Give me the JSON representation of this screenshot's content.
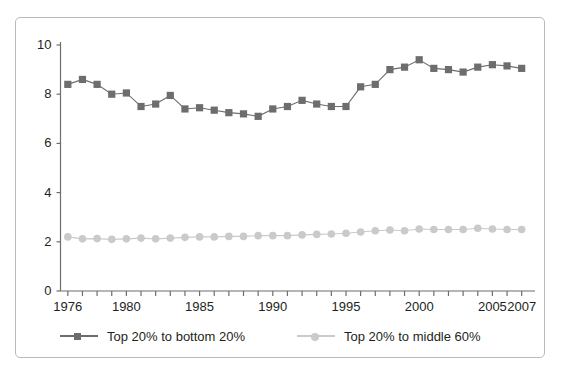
{
  "chart_data": {
    "type": "line",
    "title": "",
    "subtitle": "",
    "xlabel": "",
    "ylabel": "",
    "xlim": [
      1975.5,
      2007.5
    ],
    "ylim": [
      0,
      10
    ],
    "grid": false,
    "legend_position": "bottom-left",
    "x": [
      1976,
      1977,
      1978,
      1979,
      1980,
      1981,
      1982,
      1983,
      1984,
      1985,
      1986,
      1987,
      1988,
      1989,
      1990,
      1991,
      1992,
      1993,
      1994,
      1995,
      1996,
      1997,
      1998,
      1999,
      2000,
      2001,
      2002,
      2003,
      2004,
      2005,
      2006,
      2007
    ],
    "xticks": [
      1976,
      1977,
      1978,
      1979,
      1980,
      1981,
      1982,
      1983,
      1984,
      1985,
      1986,
      1987,
      1988,
      1989,
      1990,
      1991,
      1992,
      1993,
      1994,
      1995,
      1996,
      1997,
      1998,
      1999,
      2000,
      2001,
      2002,
      2003,
      2004,
      2005,
      2006,
      2007
    ],
    "xticklabels": [
      {
        "value": 1976,
        "text": "1976"
      },
      {
        "value": 1980,
        "text": "1980"
      },
      {
        "value": 1985,
        "text": "1985"
      },
      {
        "value": 1990,
        "text": "1990"
      },
      {
        "value": 1995,
        "text": "1995"
      },
      {
        "value": 2000,
        "text": "2000"
      },
      {
        "value": 2005,
        "text": "2005"
      },
      {
        "value": 2007,
        "text": "2007"
      }
    ],
    "yticks": [
      0,
      2,
      4,
      6,
      8,
      10
    ],
    "yticklabels": [
      "0",
      "2",
      "4",
      "6",
      "8",
      "10"
    ],
    "series": [
      {
        "name": "Top 20% to bottom 20%",
        "color": "#6d6d6d",
        "marker": "square",
        "values": [
          8.4,
          8.6,
          8.4,
          8.0,
          8.05,
          7.5,
          7.6,
          7.95,
          7.4,
          7.45,
          7.35,
          7.25,
          7.2,
          7.1,
          7.4,
          7.5,
          7.75,
          7.6,
          7.5,
          7.5,
          8.3,
          8.4,
          9.0,
          9.1,
          9.4,
          9.05,
          9.0,
          8.9,
          9.1,
          9.2,
          9.15,
          9.05
        ]
      },
      {
        "name": "Top 20% to middle 60%",
        "color": "#c9cacc",
        "marker": "circle",
        "values": [
          2.2,
          2.12,
          2.13,
          2.1,
          2.12,
          2.15,
          2.12,
          2.15,
          2.18,
          2.2,
          2.2,
          2.22,
          2.22,
          2.25,
          2.25,
          2.25,
          2.28,
          2.3,
          2.32,
          2.35,
          2.4,
          2.45,
          2.48,
          2.45,
          2.52,
          2.5,
          2.5,
          2.5,
          2.55,
          2.52,
          2.5,
          2.5
        ]
      }
    ]
  },
  "legend": {
    "entries": [
      {
        "label": "Top 20% to bottom 20%"
      },
      {
        "label": "Top 20% to middle 60%"
      }
    ]
  },
  "colors": {
    "series1": "#6d6d6d",
    "series2": "#c9cacc",
    "axis": "#6d6d6d",
    "text": "#231f20",
    "border": "#b9b9b9"
  }
}
